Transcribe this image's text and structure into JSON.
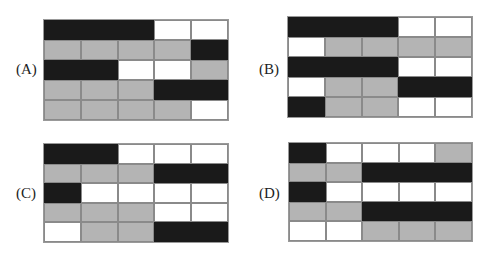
{
  "colors": {
    "B": "#1a1a1a",
    "G": "#b4b4b4",
    "W": "#ffffff"
  },
  "options": [
    {
      "label": "(A)",
      "box": {
        "x": 43,
        "y": 19,
        "w": 186,
        "h": 102
      },
      "labelPos": {
        "x": 16,
        "y": 62
      },
      "rows": [
        [
          "B",
          "B",
          "B",
          "W",
          "W"
        ],
        [
          "G",
          "G",
          "G",
          "G",
          "B"
        ],
        [
          "B",
          "B",
          "W",
          "W",
          "G"
        ],
        [
          "G",
          "G",
          "G",
          "B",
          "B"
        ],
        [
          "G",
          "G",
          "G",
          "G",
          "W"
        ]
      ]
    },
    {
      "label": "(B)",
      "box": {
        "x": 287,
        "y": 16,
        "w": 186,
        "h": 102
      },
      "labelPos": {
        "x": 259,
        "y": 62
      },
      "rows": [
        [
          "B",
          "B",
          "B",
          "W",
          "W"
        ],
        [
          "W",
          "G",
          "G",
          "G",
          "G"
        ],
        [
          "B",
          "B",
          "B",
          "W",
          "W"
        ],
        [
          "W",
          "G",
          "G",
          "B",
          "B"
        ],
        [
          "B",
          "G",
          "G",
          "W",
          "W"
        ]
      ]
    },
    {
      "label": "(C)",
      "box": {
        "x": 43,
        "y": 143,
        "w": 186,
        "h": 100
      },
      "labelPos": {
        "x": 16,
        "y": 186
      },
      "rows": [
        [
          "B",
          "B",
          "W",
          "W",
          "W"
        ],
        [
          "G",
          "G",
          "G",
          "B",
          "B"
        ],
        [
          "B",
          "W",
          "W",
          "W",
          "W"
        ],
        [
          "G",
          "G",
          "G",
          "W",
          "W"
        ],
        [
          "W",
          "G",
          "G",
          "B",
          "B"
        ]
      ]
    },
    {
      "label": "(D)",
      "box": {
        "x": 288,
        "y": 142,
        "w": 185,
        "h": 100
      },
      "labelPos": {
        "x": 259,
        "y": 186
      },
      "rows": [
        [
          "B",
          "W",
          "W",
          "W",
          "G"
        ],
        [
          "G",
          "G",
          "B",
          "B",
          "B"
        ],
        [
          "B",
          "W",
          "W",
          "W",
          "W"
        ],
        [
          "G",
          "G",
          "B",
          "B",
          "B"
        ],
        [
          "W",
          "W",
          "G",
          "G",
          "G"
        ]
      ]
    }
  ]
}
